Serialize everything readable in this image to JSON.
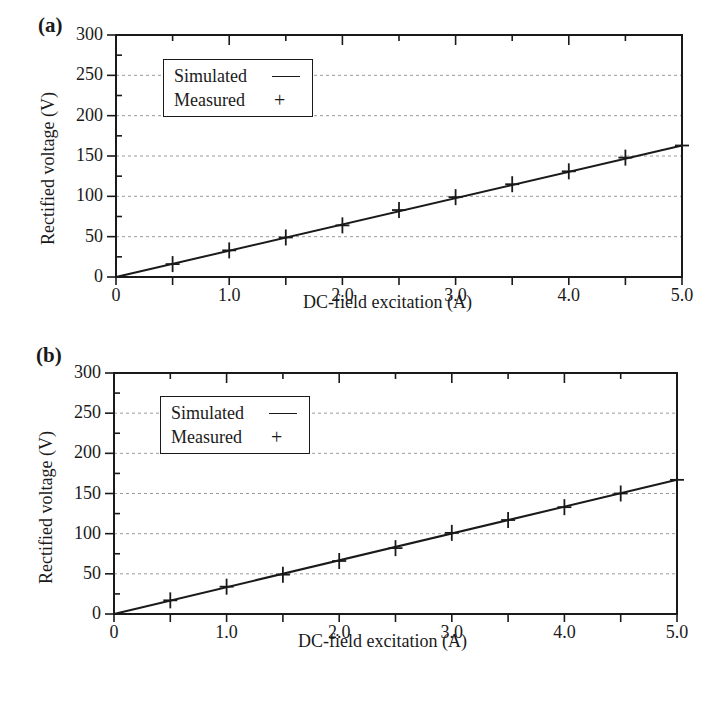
{
  "chart_data": [
    {
      "panel": "(a)",
      "type": "line",
      "title": "",
      "xlabel": "DC-field excitation (A)",
      "ylabel": "Rectified voltage (V)",
      "xlim": [
        0,
        5.0
      ],
      "ylim": [
        0,
        300
      ],
      "x_ticks": [
        "0",
        "1.0",
        "2.0",
        "3.0",
        "4.0",
        "5.0"
      ],
      "y_ticks": [
        "0",
        "50",
        "100",
        "150",
        "200",
        "250",
        "300"
      ],
      "grid": "horizontal dotted at y ticks",
      "legend": {
        "position": "upper left",
        "entries": [
          "Simulated",
          "Measured"
        ]
      },
      "series": [
        {
          "name": "Simulated",
          "style": "line",
          "x": [
            0,
            5.0
          ],
          "values": [
            0,
            163
          ]
        },
        {
          "name": "Measured",
          "style": "plus-marker",
          "x": [
            0.5,
            1.0,
            1.5,
            2.0,
            2.5,
            3.0,
            3.5,
            4.0,
            4.5,
            5.0
          ],
          "values": [
            16,
            33,
            49,
            64,
            83,
            99,
            115,
            131,
            148,
            163
          ]
        }
      ]
    },
    {
      "panel": "(b)",
      "type": "line",
      "title": "",
      "xlabel": "DC-field excitation (A)",
      "ylabel": "Rectified voltage (V)",
      "xlim": [
        0,
        5.0
      ],
      "ylim": [
        0,
        300
      ],
      "x_ticks": [
        "0",
        "1.0",
        "2.0",
        "3.0",
        "4.0",
        "5.0"
      ],
      "y_ticks": [
        "0",
        "50",
        "100",
        "150",
        "200",
        "250",
        "300"
      ],
      "grid": "horizontal dotted at y ticks",
      "legend": {
        "position": "upper left",
        "entries": [
          "Simulated",
          "Measured"
        ]
      },
      "series": [
        {
          "name": "Simulated",
          "style": "line",
          "x": [
            0,
            5.0
          ],
          "values": [
            0,
            167
          ]
        },
        {
          "name": "Measured",
          "style": "plus-marker",
          "x": [
            0.5,
            1.0,
            1.5,
            2.0,
            2.5,
            3.0,
            3.5,
            4.0,
            4.5,
            5.0
          ],
          "values": [
            17,
            34,
            49,
            66,
            82,
            101,
            117,
            133,
            150,
            167
          ]
        }
      ]
    }
  ],
  "panels": {
    "a": {
      "label": "(a)",
      "xlabel": "DC-field excitation (A)",
      "ylabel": "Rectified voltage (V)",
      "legend": {
        "simulated": "Simulated",
        "measured": "Measured"
      }
    },
    "b": {
      "label": "(b)",
      "xlabel": "DC-field excitation (A)",
      "ylabel": "Rectified voltage (V)",
      "legend": {
        "simulated": "Simulated",
        "measured": "Measured"
      }
    }
  },
  "colors": {
    "ink": "#1a1a1a",
    "grid": "#9a9a9a",
    "background": "#ffffff"
  }
}
